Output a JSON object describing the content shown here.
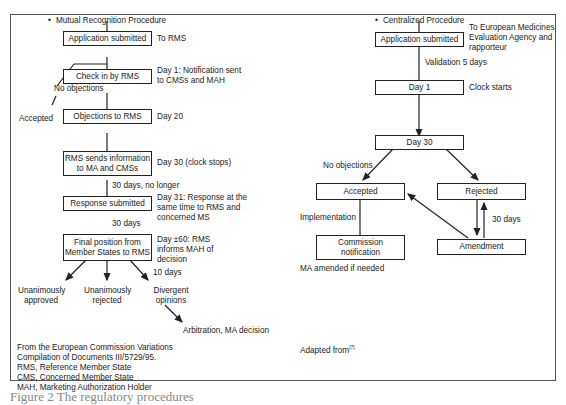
{
  "left": {
    "title": "Mutual Recognition Procedure",
    "boxes": {
      "application": "Application submitted",
      "check_in": "Check in by RMS",
      "objections": "Objections to RMS",
      "rms_sends": "RMS sends information to MA and CMSs",
      "response": "Response submitted",
      "final": "Final position from Member States to RMS"
    },
    "notes": {
      "to_rms": "To RMS",
      "day1": "Day 1: Notification sent to CMSs and MAH",
      "no_objections": "No objections",
      "accepted": "Accepted",
      "day20": "Day 20",
      "day30": "Day 30 (clock stops)",
      "thirty_no_longer": "30 days, no longer",
      "day31": "Day 31: Response at the same time to RMS and concerned MS",
      "thirty_days": "30 days",
      "day60": "Day ±60: RMS informs MAH of decision",
      "ten_days": "10 days"
    },
    "outcomes": {
      "approved": "Unanimously approved",
      "rejected": "Unanimously rejected",
      "divergent": "Divergent opinions",
      "arbitration": "Arbitration, MA decision"
    },
    "footnotes": [
      "From the European Commission Variations",
      "Compilation of Documents III/5729/95.",
      "RMS, Reference Member State",
      "CMS, Concerned Member State",
      "MAH, Marketing Authorization Holder"
    ]
  },
  "right": {
    "title": "Centralized Procedure",
    "boxes": {
      "application": "Application submitted",
      "day1": "Day 1",
      "day30": "Day 30",
      "accepted": "Accepted",
      "rejected": "Rejected",
      "commission": "Commission notification",
      "amendment": "Amendment"
    },
    "notes": {
      "to_emea": "To European Medicines Evaluation Agency and rapporteur",
      "validation": "Validation 5 days",
      "clock_starts": "Clock starts",
      "no_objections": "No objections",
      "implementation": "Implementation",
      "thirty_days": "30 days",
      "ma_amended": "MA amended if needed"
    },
    "footnote": "Adapted from",
    "footnote_ref": "[7]"
  },
  "caption": "Figure 2  The regulatory procedures"
}
